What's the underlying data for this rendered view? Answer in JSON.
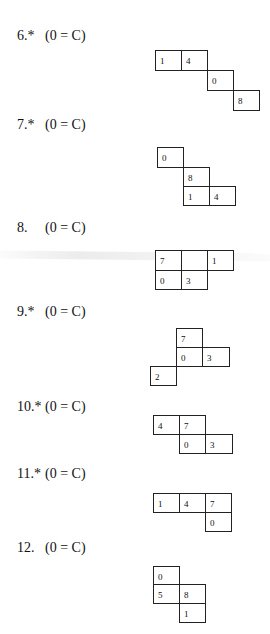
{
  "problems": [
    {
      "number": "6.*",
      "condition": "(0 = C)",
      "label_pos": [
        17,
        28
      ],
      "cells": [
        {
          "value": "1",
          "x": 155,
          "y": 50,
          "w": 27,
          "h": 21
        },
        {
          "value": "4",
          "x": 181,
          "y": 50,
          "w": 27,
          "h": 21
        },
        {
          "value": "0",
          "x": 207,
          "y": 70,
          "w": 27,
          "h": 21
        },
        {
          "value": "8",
          "x": 233,
          "y": 90,
          "w": 27,
          "h": 21
        }
      ]
    },
    {
      "number": "7.*",
      "condition": "(0 = C)",
      "label_pos": [
        17,
        117
      ],
      "cells": [
        {
          "value": "0",
          "x": 157,
          "y": 147,
          "w": 27,
          "h": 21
        },
        {
          "value": "8",
          "x": 183,
          "y": 167,
          "w": 27,
          "h": 20
        },
        {
          "value": "1",
          "x": 183,
          "y": 186,
          "w": 27,
          "h": 20
        },
        {
          "value": "4",
          "x": 209,
          "y": 186,
          "w": 27,
          "h": 20
        }
      ]
    },
    {
      "number": "8.",
      "condition": "(0 = C)",
      "label_pos": [
        17,
        220
      ],
      "cells": [
        {
          "value": "7",
          "x": 155,
          "y": 250,
          "w": 27,
          "h": 21
        },
        {
          "value": "",
          "x": 181,
          "y": 250,
          "w": 27,
          "h": 21
        },
        {
          "value": "1",
          "x": 207,
          "y": 250,
          "w": 27,
          "h": 21
        },
        {
          "value": "0",
          "x": 155,
          "y": 270,
          "w": 27,
          "h": 20
        },
        {
          "value": "3",
          "x": 181,
          "y": 270,
          "w": 27,
          "h": 20
        }
      ]
    },
    {
      "number": "9.*",
      "condition": "(0 = C)",
      "label_pos": [
        17,
        304
      ],
      "cells": [
        {
          "value": "7",
          "x": 176,
          "y": 328,
          "w": 27,
          "h": 20
        },
        {
          "value": "0",
          "x": 176,
          "y": 347,
          "w": 27,
          "h": 20
        },
        {
          "value": "3",
          "x": 202,
          "y": 347,
          "w": 28,
          "h": 20
        },
        {
          "value": "2",
          "x": 150,
          "y": 366,
          "w": 27,
          "h": 20
        }
      ]
    },
    {
      "number": "10.*",
      "condition": "(0 = C)",
      "label_pos": [
        17,
        399
      ],
      "cells": [
        {
          "value": "4",
          "x": 153,
          "y": 415,
          "w": 27,
          "h": 20
        },
        {
          "value": "7",
          "x": 179,
          "y": 415,
          "w": 27,
          "h": 20
        },
        {
          "value": "0",
          "x": 179,
          "y": 434,
          "w": 27,
          "h": 20
        },
        {
          "value": "3",
          "x": 205,
          "y": 434,
          "w": 28,
          "h": 20
        }
      ]
    },
    {
      "number": "11.*",
      "condition": "(0 = C)",
      "label_pos": [
        17,
        466
      ],
      "cells": [
        {
          "value": "1",
          "x": 153,
          "y": 493,
          "w": 27,
          "h": 20
        },
        {
          "value": "4",
          "x": 179,
          "y": 493,
          "w": 27,
          "h": 20
        },
        {
          "value": "7",
          "x": 205,
          "y": 493,
          "w": 27,
          "h": 20
        },
        {
          "value": "0",
          "x": 205,
          "y": 512,
          "w": 27,
          "h": 20
        }
      ]
    },
    {
      "number": "12.",
      "condition": "(0 = C)",
      "label_pos": [
        17,
        540
      ],
      "cells": [
        {
          "value": "0",
          "x": 153,
          "y": 566,
          "w": 27,
          "h": 19
        },
        {
          "value": "5",
          "x": 153,
          "y": 584,
          "w": 27,
          "h": 20
        },
        {
          "value": "8",
          "x": 179,
          "y": 584,
          "w": 27,
          "h": 20
        },
        {
          "value": "1",
          "x": 179,
          "y": 603,
          "w": 27,
          "h": 20
        }
      ]
    }
  ]
}
